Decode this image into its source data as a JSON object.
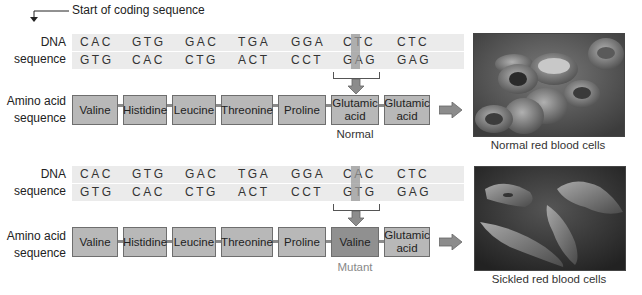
{
  "start_label": "Start of coding sequence",
  "labels": {
    "dna": [
      "DNA",
      "sequence"
    ],
    "amino": [
      "Amino acid",
      "sequence"
    ]
  },
  "normal": {
    "dna_top": [
      "CAC",
      "GTG",
      "GAC",
      "TGA",
      "GGA",
      "CTC",
      "CTC"
    ],
    "dna_bottom": [
      "GTG",
      "CAC",
      "CTG",
      "ACT",
      "CCT",
      "GAG",
      "GAG"
    ],
    "highlight_base_top": "T",
    "highlight_base_bottom": "A",
    "amino_acids": [
      "Valine",
      "Histidine",
      "Leucine",
      "Threonine",
      "Proline",
      "Glutamic acid",
      "Glutamic acid"
    ],
    "caption": "Normal",
    "image_caption": "Normal red blood cells"
  },
  "mutant": {
    "dna_top": [
      "CAC",
      "GTG",
      "GAC",
      "TGA",
      "GGA",
      "CAC",
      "CTC"
    ],
    "dna_bottom": [
      "GTG",
      "CAC",
      "CTG",
      "ACT",
      "CCT",
      "GTG",
      "GAG"
    ],
    "highlight_base_top": "A",
    "highlight_base_bottom": "T",
    "amino_acids": [
      "Valine",
      "Histidine",
      "Leucine",
      "Threonine",
      "Proline",
      "Valine",
      "Glutamic acid"
    ],
    "caption": "Mutant",
    "image_caption": "Sickled red blood cells"
  },
  "colors": {
    "strip": "#ebebeb",
    "box": "#b8b8b8",
    "box_mutant": "#909090",
    "arrow": "#8c8c8c"
  }
}
